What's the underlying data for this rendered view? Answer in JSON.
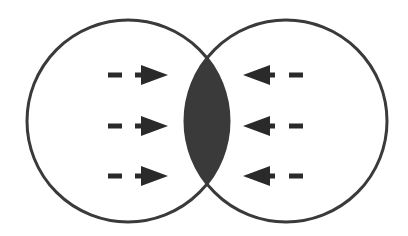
{
  "diagram": {
    "type": "two-overlapping-circles",
    "colors": {
      "background": "#ffffff",
      "stroke": "#3a3a3a",
      "overlap_fill": "#3a3a3a",
      "arrow": "#2a2a2a"
    },
    "circles": [
      {
        "id": "left",
        "cx": 128,
        "cy": 121,
        "r": 101
      },
      {
        "id": "right",
        "cx": 286,
        "cy": 121,
        "r": 101
      }
    ],
    "overlap": {
      "label": "",
      "filled": true
    },
    "arrows": {
      "left_circle": {
        "direction": "right",
        "count": 3,
        "rows_y": [
          75,
          126,
          176
        ]
      },
      "right_circle": {
        "direction": "left",
        "count": 3,
        "rows_y": [
          75,
          126,
          176
        ]
      }
    }
  }
}
